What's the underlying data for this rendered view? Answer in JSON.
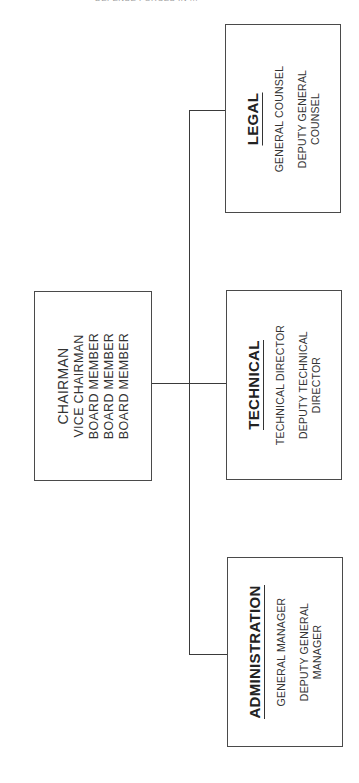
{
  "header": {
    "cropped_text": "DEFENSE FORCES IN ..."
  },
  "orientation": "rotated -90deg (text reads bottom-to-top)",
  "board": {
    "lines": [
      "CHAIRMAN",
      "VICE CHAIRMAN",
      "BOARD MEMBER",
      "BOARD MEMBER",
      "BOARD MEMBER"
    ]
  },
  "departments": [
    {
      "id": "legal",
      "title": "LEGAL",
      "roles": [
        "GENERAL COUNSEL",
        "DEPUTY GENERAL COUNSEL"
      ]
    },
    {
      "id": "technical",
      "title": "TECHNICAL",
      "roles": [
        "TECHNICAL DIRECTOR",
        "DEPUTY TECHNICAL DIRECTOR"
      ]
    },
    {
      "id": "administration",
      "title": "ADMINISTRATION",
      "roles": [
        "GENERAL MANAGER",
        "DEPUTY GENERAL MANAGER"
      ]
    }
  ],
  "colors": {
    "border": "#4a4a4a",
    "text": "#333333",
    "background": "#ffffff"
  }
}
